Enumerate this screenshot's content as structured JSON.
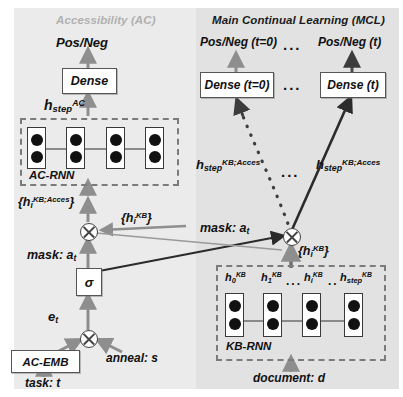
{
  "figure": {
    "panels": {
      "ac": {
        "title": "Accessibility (AC)",
        "color": "#b0b0b0",
        "bg": "#ebebeb"
      },
      "mcl": {
        "title": "Main Continual Learning (MCL)",
        "color": "#1a1a1a",
        "bg": "#e2e2e2"
      }
    },
    "ac_branch": {
      "output_label": "Pos/Neg",
      "dense_label": "Dense",
      "hstep_h": "h",
      "hstep_sub": "step",
      "hstep_sup": "AC",
      "rnn_name": "AC-RNN",
      "rnn_cells": 4,
      "dots_per_cell": 2
    },
    "mcl_branch": {
      "output_t0": "Pos/Neg (t=0)",
      "output_t": "Pos/Neg (t)",
      "dense_t0": "Dense (t=0)",
      "dense_t": "Dense (t)",
      "ellipsis_top": "...",
      "ellipsis_mid": "...",
      "ellipsis_dense": "...",
      "hstep_left_h": "h",
      "hstep_left_sub": "step",
      "hstep_left_sup": "KB;Acces",
      "hstep_right_h": "h",
      "hstep_right_sub": "step",
      "hstep_right_sup": "KB;Acces"
    },
    "kb": {
      "rnn_name": "KB-RNN",
      "input_label": "document: d",
      "set_label_h": "{h",
      "set_label_sub": "i",
      "set_label_sup": "KB",
      "set_label_close": "}",
      "mask_label": "mask: a",
      "mask_sub": "t",
      "states": [
        {
          "h": "h",
          "sub": "0",
          "sup": "KB"
        },
        {
          "h": "h",
          "sub": "1",
          "sup": "KB"
        },
        {
          "h": "h",
          "sub": "i",
          "sup": "KB"
        },
        {
          "h": "h",
          "sub": "step",
          "sup": "KB"
        }
      ],
      "state_ellipsis_1": "...",
      "state_ellipsis_2": "..",
      "rnn_cells": 4
    },
    "ac_mask_path": {
      "masked_set_h": "{h",
      "masked_set_sub": "i",
      "masked_set_sup": "KB;Acces",
      "masked_set_close": "}",
      "kb_set_h": "{h",
      "kb_set_sub": "i",
      "kb_set_sup": "KB",
      "kb_set_close": "}",
      "mask_label": "mask: a",
      "mask_sub": "t",
      "sigma_label": "σ",
      "e_label": "e",
      "e_sub": "t",
      "emb_label": "AC-EMB",
      "anneal_label": "anneal: s",
      "task_label": "task: t"
    }
  }
}
